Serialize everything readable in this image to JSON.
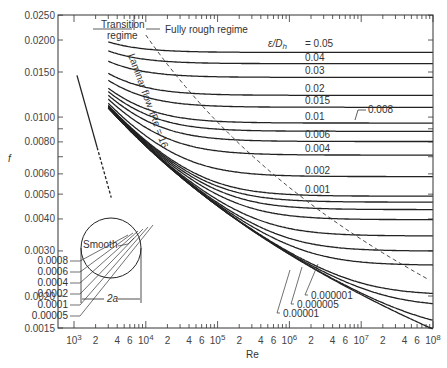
{
  "chart_data": {
    "type": "line",
    "xlabel": "Re",
    "ylabel": "f",
    "xscale": "log",
    "yscale": "log",
    "xlim": [
      1000,
      100000000
    ],
    "ylim": [
      0.0015,
      0.025
    ],
    "x_ticks": [
      {
        "v": 1000,
        "label": "10³"
      },
      {
        "v": 2000,
        "label": "2"
      },
      {
        "v": 4000,
        "label": "4"
      },
      {
        "v": 6000,
        "label": "6"
      },
      {
        "v": 10000,
        "label": "10⁴"
      },
      {
        "v": 20000,
        "label": "2"
      },
      {
        "v": 40000,
        "label": "4"
      },
      {
        "v": 60000,
        "label": "6"
      },
      {
        "v": 100000,
        "label": "10⁵"
      },
      {
        "v": 200000,
        "label": "2"
      },
      {
        "v": 400000,
        "label": "4"
      },
      {
        "v": 600000,
        "label": "6"
      },
      {
        "v": 1000000,
        "label": "10⁶"
      },
      {
        "v": 2000000,
        "label": "2"
      },
      {
        "v": 4000000,
        "label": "4"
      },
      {
        "v": 6000000,
        "label": "6"
      },
      {
        "v": 10000000,
        "label": "10⁷"
      },
      {
        "v": 20000000,
        "label": "2"
      },
      {
        "v": 40000000,
        "label": "4"
      },
      {
        "v": 60000000,
        "label": "6"
      },
      {
        "v": 100000000,
        "label": "10⁸"
      }
    ],
    "y_ticks": [
      {
        "v": 0.0015,
        "label": "0.0015"
      },
      {
        "v": 0.002,
        "label": "0.0020"
      },
      {
        "v": 0.003,
        "label": "0.0030"
      },
      {
        "v": 0.004,
        "label": "0.0040"
      },
      {
        "v": 0.005,
        "label": "0.0050"
      },
      {
        "v": 0.006,
        "label": "0.0060"
      },
      {
        "v": 0.007,
        "label": ""
      },
      {
        "v": 0.008,
        "label": "0.0080"
      },
      {
        "v": 0.009,
        "label": ""
      },
      {
        "v": 0.01,
        "label": "0.0100"
      },
      {
        "v": 0.015,
        "label": "0.0150"
      },
      {
        "v": 0.02,
        "label": "0.0200"
      },
      {
        "v": 0.025,
        "label": "0.0250"
      }
    ],
    "series_parameter": "ε/D_h",
    "series": [
      {
        "name": "0.05",
        "rel_roughness": 0.05
      },
      {
        "name": "0.04",
        "rel_roughness": 0.04
      },
      {
        "name": "0.03",
        "rel_roughness": 0.03
      },
      {
        "name": "0.02",
        "rel_roughness": 0.02
      },
      {
        "name": "0.015",
        "rel_roughness": 0.015
      },
      {
        "name": "0.01",
        "rel_roughness": 0.01
      },
      {
        "name": "0.008",
        "rel_roughness": 0.008
      },
      {
        "name": "0.006",
        "rel_roughness": 0.006
      },
      {
        "name": "0.004",
        "rel_roughness": 0.004
      },
      {
        "name": "0.002",
        "rel_roughness": 0.002
      },
      {
        "name": "0.001",
        "rel_roughness": 0.001
      },
      {
        "name": "0.0008",
        "rel_roughness": 0.0008
      },
      {
        "name": "0.0006",
        "rel_roughness": 0.0006
      },
      {
        "name": "0.0004",
        "rel_roughness": 0.0004
      },
      {
        "name": "0.0002",
        "rel_roughness": 0.0002
      },
      {
        "name": "0.0001",
        "rel_roughness": 0.0001
      },
      {
        "name": "0.00005",
        "rel_roughness": 5e-05
      },
      {
        "name": "0.00001",
        "rel_roughness": 1e-05
      },
      {
        "name": "0.000005",
        "rel_roughness": 5e-06
      },
      {
        "name": "0.000001",
        "rel_roughness": 1e-06
      },
      {
        "name": "Smooth",
        "rel_roughness": 0
      }
    ],
    "turbulent_re_start": 3000,
    "laminar": {
      "label": "Laminar flow, fRe = 16",
      "equation": "f = 16/Re",
      "re_range": [
        1000,
        3000
      ]
    },
    "annotations": [
      {
        "text": "Transition regime"
      },
      {
        "text": "Fully rough regime"
      },
      {
        "text": "ε/D_h = 0.05"
      },
      {
        "text": "Smooth"
      },
      {
        "text": "2a"
      }
    ]
  },
  "labels": {
    "y_axis": "f",
    "x_axis": "Re",
    "transition_1": "Transition",
    "transition_2": "regime",
    "fully_rough": "Fully rough regime",
    "eps_prefix": "ε/D",
    "eps_sub": "h",
    "eps_first": "= 0.05",
    "laminar": "Laminar flow, fRe = 16",
    "smooth": "Smooth",
    "pipe_dim": "2a",
    "right_labels": [
      "0.04",
      "0.03",
      "0.02",
      "0.015",
      "0.01",
      "0.006",
      "0.004",
      "0.002",
      "0.001"
    ],
    "label_008": "0.008",
    "left_small": [
      "0.0008",
      "0.0006",
      "0.0004",
      "0.0002",
      "0.0001",
      "0.00005"
    ],
    "bottom_small": [
      "0.00001",
      "0.000005",
      "0.000001"
    ]
  }
}
